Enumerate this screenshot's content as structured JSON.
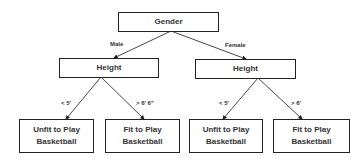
{
  "diagram": {
    "type": "decision-tree",
    "nodes": {
      "root": {
        "label": "Gender"
      },
      "height_male": {
        "label": "Height"
      },
      "height_female": {
        "label": "Height"
      },
      "leaf_male_short": {
        "line1": "Unfit to Play",
        "line2": "Basketball"
      },
      "leaf_male_tall": {
        "line1": "Fit to Play",
        "line2": "Basketball"
      },
      "leaf_female_short": {
        "line1": "Unfit to Play",
        "line2": "Basketball"
      },
      "leaf_female_tall": {
        "line1": "Fit to Play",
        "line2": "Basketball"
      }
    },
    "edges": [
      {
        "from": "root",
        "to": "height_male",
        "label": "Male"
      },
      {
        "from": "root",
        "to": "height_female",
        "label": "Female"
      },
      {
        "from": "height_male",
        "to": "leaf_male_short",
        "label": "< 5'"
      },
      {
        "from": "height_male",
        "to": "leaf_male_tall",
        "label": "> 6' 6\""
      },
      {
        "from": "height_female",
        "to": "leaf_female_short",
        "label": "< 5'"
      },
      {
        "from": "height_female",
        "to": "leaf_female_tall",
        "label": "> 6'"
      }
    ],
    "colors": {
      "stroke": "#222222",
      "text": "#333333"
    }
  }
}
